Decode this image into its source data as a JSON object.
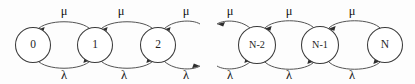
{
  "diagram": {
    "type": "state-transition-diagram",
    "background_color": "#fdfdfd",
    "stroke_color": "#4a4a4a",
    "node_fill": "#ffffff",
    "text_color": "#141414",
    "up_rate_symbol": "μ",
    "down_rate_symbol": "λ",
    "ellipsis_gap": true,
    "nodes": [
      {
        "id": "n0",
        "label": "0",
        "cx": 33,
        "cy": 45,
        "r": 17.5,
        "size": "normal"
      },
      {
        "id": "n1",
        "label": "1",
        "cx": 95,
        "cy": 45,
        "r": 17.5,
        "size": "normal"
      },
      {
        "id": "n2",
        "label": "2",
        "cx": 158,
        "cy": 45,
        "r": 17.5,
        "size": "normal"
      },
      {
        "id": "nN2",
        "label": "N-2",
        "cx": 257,
        "cy": 45,
        "r": 18.5,
        "size": "small"
      },
      {
        "id": "nN1",
        "label": "N-1",
        "cx": 320,
        "cy": 45,
        "r": 18.5,
        "size": "small"
      },
      {
        "id": "nN",
        "label": "N",
        "cx": 385,
        "cy": 45,
        "r": 17.5,
        "size": "normal"
      }
    ],
    "mu_labels": [
      {
        "text": "μ",
        "x": 64,
        "y": 12
      },
      {
        "text": "μ",
        "x": 121,
        "y": 12
      },
      {
        "text": "μ",
        "x": 186,
        "y": 12
      },
      {
        "text": "μ",
        "x": 230,
        "y": 12
      },
      {
        "text": "μ",
        "x": 289,
        "y": 12
      },
      {
        "text": "μ",
        "x": 352,
        "y": 12
      }
    ],
    "lambda_labels": [
      {
        "text": "λ",
        "x": 64,
        "y": 76
      },
      {
        "text": "λ",
        "x": 124,
        "y": 76
      },
      {
        "text": "λ",
        "x": 186,
        "y": 76
      },
      {
        "text": "λ",
        "x": 230,
        "y": 76
      },
      {
        "text": "λ",
        "x": 289,
        "y": 76
      },
      {
        "text": "λ",
        "x": 352,
        "y": 76
      }
    ],
    "transitions": [
      {
        "from": "0",
        "to": "1",
        "rate": "λ",
        "direction": "right"
      },
      {
        "from": "1",
        "to": "0",
        "rate": "μ",
        "direction": "left"
      },
      {
        "from": "1",
        "to": "2",
        "rate": "λ",
        "direction": "right"
      },
      {
        "from": "2",
        "to": "1",
        "rate": "μ",
        "direction": "left"
      },
      {
        "from": "2",
        "to": "3",
        "rate": "λ",
        "direction": "right"
      },
      {
        "from": "3",
        "to": "2",
        "rate": "μ",
        "direction": "left"
      },
      {
        "from": "N-3",
        "to": "N-2",
        "rate": "λ",
        "direction": "right"
      },
      {
        "from": "N-2",
        "to": "N-3",
        "rate": "μ",
        "direction": "left"
      },
      {
        "from": "N-2",
        "to": "N-1",
        "rate": "λ",
        "direction": "right"
      },
      {
        "from": "N-1",
        "to": "N-2",
        "rate": "μ",
        "direction": "left"
      },
      {
        "from": "N-1",
        "to": "N",
        "rate": "λ",
        "direction": "right"
      },
      {
        "from": "N",
        "to": "N-1",
        "rate": "μ",
        "direction": "left"
      }
    ]
  }
}
